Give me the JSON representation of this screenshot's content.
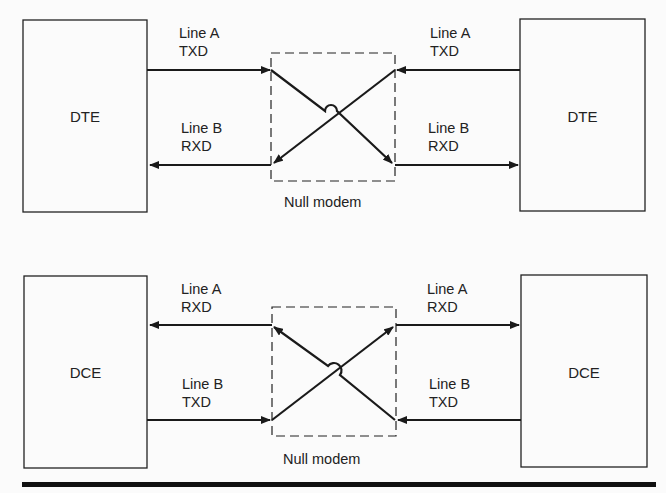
{
  "top": {
    "left_device": "DTE",
    "right_device": "DTE",
    "left_line_a": {
      "line": "Line A",
      "signal": "TXD"
    },
    "left_line_b": {
      "line": "Line B",
      "signal": "RXD"
    },
    "right_line_a": {
      "line": "Line A",
      "signal": "TXD"
    },
    "right_line_b": {
      "line": "Line B",
      "signal": "RXD"
    },
    "null_modem_label": "Null modem"
  },
  "bottom": {
    "left_device": "DCE",
    "right_device": "DCE",
    "left_line_a": {
      "line": "Line A",
      "signal": "RXD"
    },
    "left_line_b": {
      "line": "Line B",
      "signal": "TXD"
    },
    "right_line_a": {
      "line": "Line A",
      "signal": "RXD"
    },
    "right_line_b": {
      "line": "Line B",
      "signal": "TXD"
    },
    "null_modem_label": "Null modem"
  }
}
